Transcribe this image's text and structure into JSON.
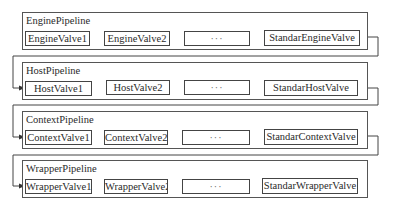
{
  "pipelines": [
    {
      "name": "EnginePipeline",
      "valves": [
        "EngineValve1",
        "EngineValve2",
        "···",
        "StandarEngineValve"
      ]
    },
    {
      "name": "HostPipeline",
      "valves": [
        "HostValve1",
        "HostValve2",
        "···",
        "StandarHostValve"
      ]
    },
    {
      "name": "ContextPipeline",
      "valves": [
        "ContextValve1",
        "ContextValve2",
        "···",
        "StandarContextValve"
      ]
    },
    {
      "name": "WrapperPipeline",
      "valves": [
        "WrapperValve1",
        "WrapperValve2",
        "···",
        "StandarWrapperValve"
      ]
    }
  ],
  "colors": {
    "line": "#444444",
    "background": "#ffffff"
  }
}
